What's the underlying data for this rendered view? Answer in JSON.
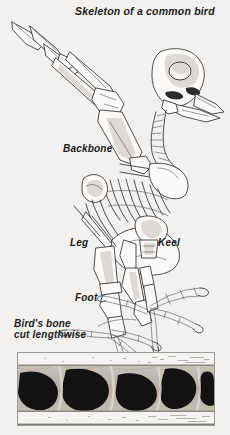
{
  "figure": {
    "kind": "scanned-textbook-illustration",
    "background_color": "#f2f1ef",
    "ink_color": "#3a3a3c"
  },
  "title": {
    "text": "Skeleton of a common bird"
  },
  "labels": {
    "backbone": "Backbone",
    "leg": "Leg",
    "keel": "Keel",
    "foot": "Foot",
    "bone_cut_line1": "Bird's bone",
    "bone_cut_line2": "cut lengthwise"
  },
  "photo": {
    "caption_line1": "Bird's bone",
    "caption_line2": "cut lengthwise",
    "description": "black-and-white photomicrograph of hollow bone interior showing dark air cavities separated by pale supporting struts",
    "border_color": "#9a9a98",
    "matrix_color": "#b9b5ae",
    "cavity_color": "#111111",
    "band_color": "#f4f3f1"
  },
  "parts": {
    "wing": "wing-bones",
    "skull": "skull",
    "beak": "beak",
    "eye_socket": "eye-socket",
    "ribcage": "ribcage",
    "pelvis": "pelvis",
    "sternum": "sternum-keel",
    "femur": "femur",
    "tibia": "tibia",
    "tarsus": "tarsus",
    "toes": "toes-and-claws",
    "tail": "tail-vertebrae"
  }
}
